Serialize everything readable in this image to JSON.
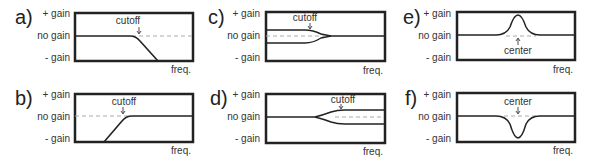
{
  "axis": {
    "plus_gain": "+ gain",
    "no_gain": "no gain",
    "minus_gain": "- gain",
    "freq": "freq."
  },
  "colors": {
    "line": "#222222",
    "dashed": "#aaaaaa",
    "frame": "#222222"
  },
  "panels": [
    {
      "id": "a",
      "letter": "a)",
      "type": "low-pass",
      "annotation": "cutoff"
    },
    {
      "id": "b",
      "letter": "b)",
      "type": "high-pass",
      "annotation": "cutoff"
    },
    {
      "id": "c",
      "letter": "c)",
      "type": "low-shelf",
      "annotation": "cutoff"
    },
    {
      "id": "d",
      "letter": "d)",
      "type": "high-shelf",
      "annotation": "cutoff"
    },
    {
      "id": "e",
      "letter": "e)",
      "type": "peak-boost",
      "annotation": "center"
    },
    {
      "id": "f",
      "letter": "f)",
      "type": "peak-cut",
      "annotation": "center"
    }
  ]
}
